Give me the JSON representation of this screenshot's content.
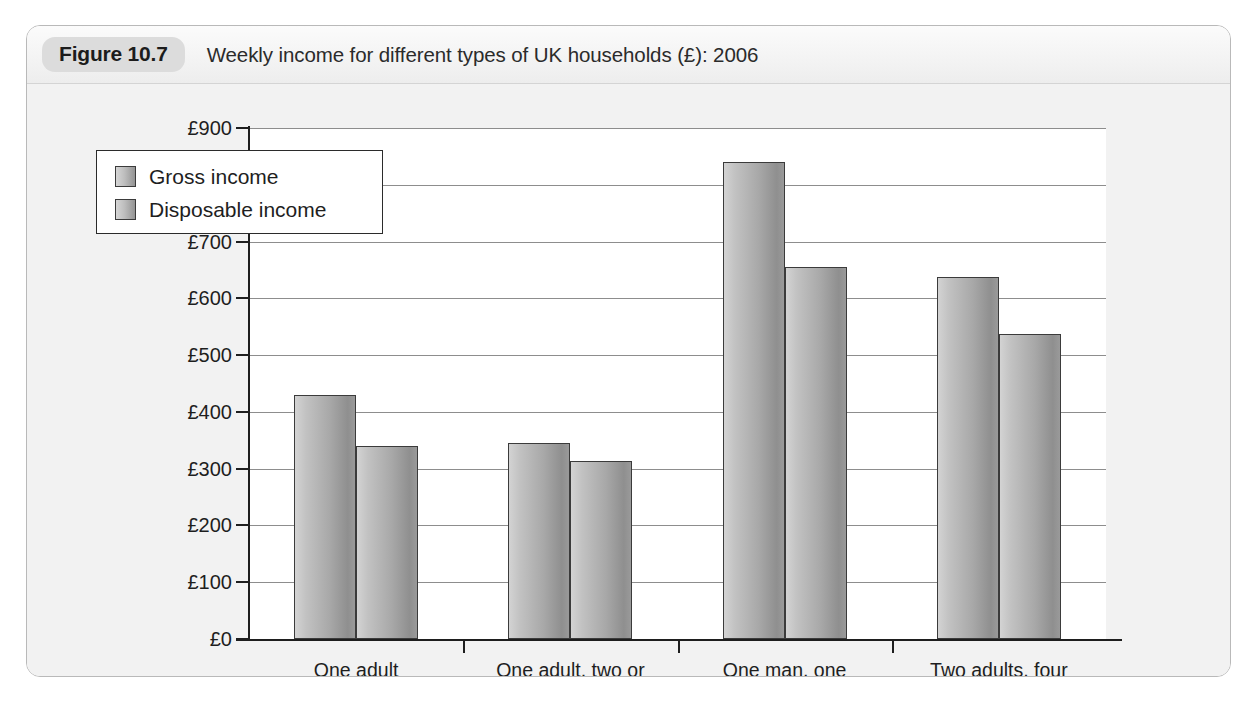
{
  "figure": {
    "badge": "Figure 10.7",
    "caption": "Weekly income for different types of UK households (£): 2006"
  },
  "colors": {
    "card_border": "#b9b9b9",
    "badge_bg": "#dcdcdc",
    "panel_bg": "#f2f2f2",
    "plot_bg": "#ffffff",
    "axis": "#1e1e1e",
    "gridline": "#8d8d8d",
    "bar_light": "#d3d3d3",
    "bar_dark": "#8f8f8f",
    "bar_outline": "#3b3b3b"
  },
  "chart_data": {
    "type": "bar",
    "title": "Weekly income for different types of UK households (£): 2006",
    "xlabel": "",
    "ylabel": "",
    "ylim": [
      0,
      900
    ],
    "ytick_step": 100,
    "yticks": [
      0,
      100,
      200,
      300,
      400,
      500,
      600,
      700,
      800,
      900
    ],
    "ytick_labels": [
      "£0",
      "£100",
      "£200",
      "£300",
      "£400",
      "£500",
      "£600",
      "£700",
      "£800",
      "£900"
    ],
    "grid": true,
    "legend_position": "upper left (inside plot)",
    "categories": [
      "One adult\n(not retired)",
      "One adult, two or\nmore children",
      "One man, one\nwoman (not retired)",
      "Two adults, four\nor more children"
    ],
    "category_lines": [
      [
        "One adult",
        "(not retired)"
      ],
      [
        "One adult, two or",
        "more children"
      ],
      [
        "One man, one",
        "woman (not retired)"
      ],
      [
        "Two adults, four",
        "or more children"
      ]
    ],
    "series": [
      {
        "name": "Gross income",
        "values": [
          430,
          345,
          840,
          638
        ]
      },
      {
        "name": "Disposable income",
        "values": [
          340,
          313,
          655,
          538
        ]
      }
    ]
  }
}
